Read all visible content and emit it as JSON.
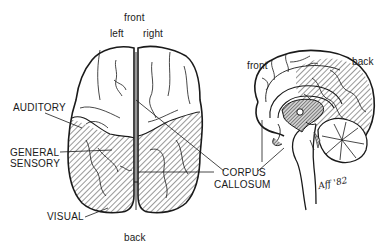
{
  "top_view": {
    "orientation": {
      "front": "front",
      "left": "left",
      "right": "right",
      "back": "back"
    },
    "labels": {
      "auditory": "AUDITORY",
      "general_sensory_line1": "GENERAL",
      "general_sensory_line2": "SENSORY",
      "visual": "VISUAL",
      "corpus_callosum_line1": "CORPUS",
      "corpus_callosum_line2": "CALLOSUM"
    }
  },
  "side_view": {
    "orientation": {
      "front": "front",
      "back": "back"
    }
  },
  "signature": "Aff '82",
  "colors": {
    "ink": "#1a1a1a",
    "background": "#ffffff",
    "hatch": "#333333",
    "dense_shade": "#8a8a8a"
  }
}
